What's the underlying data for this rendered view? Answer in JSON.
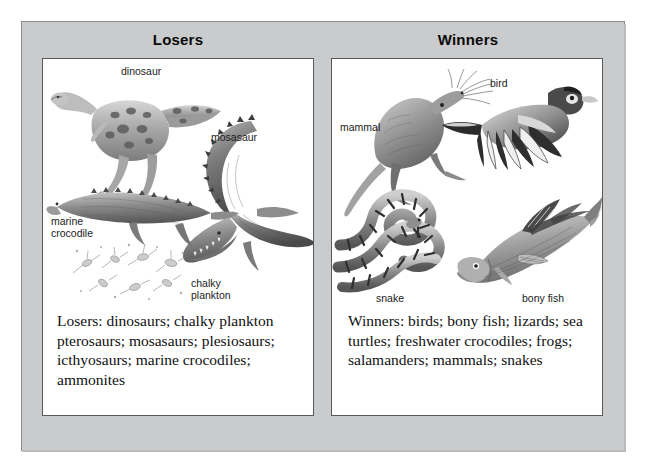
{
  "figure": {
    "frame_color": "#c9cbcc",
    "panel_background": "#ffffff",
    "border_color": "#58595b"
  },
  "columns": [
    {
      "id": "losers",
      "heading": "Losers",
      "summary": "Losers: dinosaurs; chalky plankton pterosaurs; mosasaurs; plesiosaurs; icthyosaurs; marine crocodiles; ammonites",
      "labels": [
        {
          "name": "dinosaur-label",
          "text": "dinosaur",
          "lines": [
            "dinosaur"
          ]
        },
        {
          "name": "mosasaur-label",
          "text": "mosasaur",
          "lines": [
            "mosasaur"
          ]
        },
        {
          "name": "marine-crocodile-label",
          "text": "marine crocodile",
          "lines": [
            "marine",
            "crocodile"
          ]
        },
        {
          "name": "chalky-plankton-label",
          "text": "chalky plankton",
          "lines": [
            "chalky",
            "plankton"
          ]
        }
      ]
    },
    {
      "id": "winners",
      "heading": "Winners",
      "summary": "Winners: birds; bony fish; lizards; sea turtles; freshwater crocodiles; frogs; salamanders; mammals; snakes",
      "labels": [
        {
          "name": "mammal-label",
          "text": "mammal",
          "lines": [
            "mammal"
          ]
        },
        {
          "name": "bird-label",
          "text": "bird",
          "lines": [
            "bird"
          ]
        },
        {
          "name": "snake-label",
          "text": "snake",
          "lines": [
            "snake"
          ]
        },
        {
          "name": "bony-fish-label",
          "text": "bony fish",
          "lines": [
            "bony fish"
          ]
        }
      ]
    }
  ]
}
